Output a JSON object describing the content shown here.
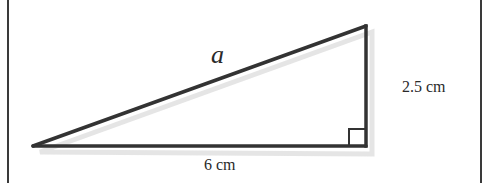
{
  "diagram": {
    "type": "right-triangle",
    "labels": {
      "hypotenuse": "a",
      "vertical_leg": "2.5 cm",
      "base": "6 cm"
    },
    "right_angle_marker": true,
    "colors": {
      "stroke": "#333333",
      "shadow": "#d9d9d9",
      "frame": "#3a3a3a",
      "background": "#ffffff"
    }
  }
}
